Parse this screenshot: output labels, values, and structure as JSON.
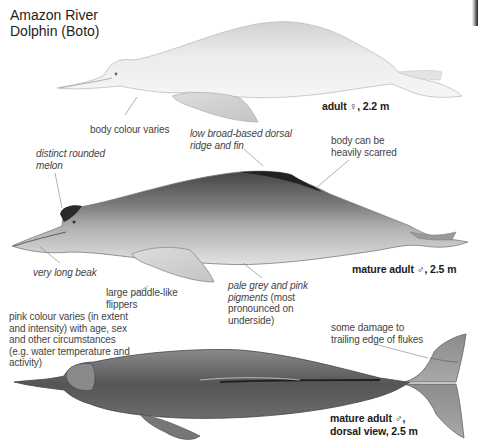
{
  "title": {
    "line1": "Amazon River",
    "line2": "Dolphin (Boto)"
  },
  "figures": [
    {
      "id": "adult-female",
      "caption": "adult ♀, 2.2 m",
      "tone": "pale pink-white",
      "colors": {
        "body": "#e6e6e6",
        "shade": "#c9c9c9"
      }
    },
    {
      "id": "mature-male-lateral",
      "caption": "mature adult ♂, 2.5 m",
      "tone": "grey with pink underside",
      "colors": {
        "body": "#8a8a8a",
        "shade": "#4e4e4e",
        "belly": "#dcdcdc"
      }
    },
    {
      "id": "mature-male-dorsal",
      "caption_line1": "mature adult ♂,",
      "caption_line2": "dorsal view, 2.5 m",
      "tone": "dark grey",
      "colors": {
        "body": "#6e6e6e",
        "shade": "#3a3a3a"
      }
    }
  ],
  "annotations": {
    "body_colour": "body colour varies",
    "dorsal_ridge_1": "low broad-based dorsal",
    "dorsal_ridge_2": "ridge and fin",
    "scarred_1": "body can be",
    "scarred_2": "heavily scarred",
    "melon_1": "distinct rounded",
    "melon_2": "melon",
    "beak": "very long beak",
    "flippers_1": "large paddle-like",
    "flippers_2": "flippers",
    "pigments_1a": "pale grey and pink",
    "pigments_2a": "pigments",
    "pigments_2b": " (most",
    "pigments_3": "pronounced on",
    "pigments_4": "underside)",
    "pink_1": "pink colour varies (in extent",
    "pink_2": "and intensity) with age, sex",
    "pink_3": "and other circumstances",
    "pink_4": "(e.g. water temperature and",
    "pink_5": "activity)",
    "flukes_1": "some damage to",
    "flukes_2": "trailing edge of flukes"
  }
}
